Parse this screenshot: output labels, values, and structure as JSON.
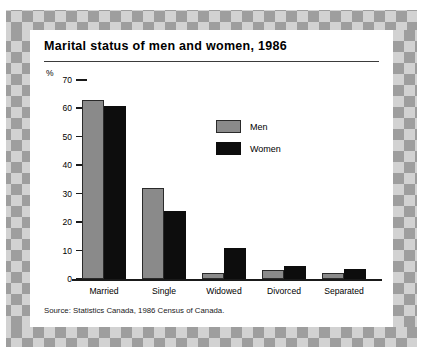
{
  "chart_data": {
    "type": "bar",
    "title": "Marital status of men and women, 1986",
    "xlabel": "",
    "ylabel": "%",
    "ylim": [
      0,
      70
    ],
    "yticks": [
      70,
      60,
      50,
      40,
      30,
      20,
      10,
      0
    ],
    "grid": false,
    "legend_position": "inside-upper-center",
    "categories": [
      "Married",
      "Single",
      "Widowed",
      "Divorced",
      "Separated"
    ],
    "series": [
      {
        "name": "Men",
        "color": "#8a8a8a",
        "values": [
          63,
          32,
          2,
          3,
          2
        ]
      },
      {
        "name": "Women",
        "color": "#0d0d0d",
        "values": [
          61,
          24,
          11,
          4.5,
          3.5
        ]
      }
    ],
    "source": "Source: Statistics Canada, 1986 Census of Canada."
  }
}
